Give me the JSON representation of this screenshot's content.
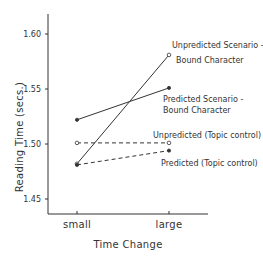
{
  "chart_data": {
    "type": "line",
    "title": "",
    "xlabel": "Time Change",
    "ylabel": "Reading Time (secs.)",
    "categories": [
      "small",
      "large"
    ],
    "ylim": [
      1.44,
      1.62
    ],
    "yticks": [
      1.45,
      1.5,
      1.55,
      1.6
    ],
    "ytick_labels": [
      "1.45",
      "1.50",
      "1.55",
      "1.60"
    ],
    "grid": false,
    "legend": "inline annotations at right",
    "series": [
      {
        "name": "Unpredicted Scenario-Bound Character",
        "label_lines": [
          "Unpredicted Scenario -",
          "Bound Character"
        ],
        "values": [
          1.482,
          1.581
        ],
        "line_style": "solid",
        "marker": "open-circle"
      },
      {
        "name": "Predicted Scenario-Bound Character",
        "label_lines": [
          "Predicted Scenario -",
          "Bound Character"
        ],
        "values": [
          1.522,
          1.551
        ],
        "line_style": "solid",
        "marker": "filled-circle"
      },
      {
        "name": "Unpredicted (Topic control)",
        "label_lines": [
          "Unpredicted (Topic control)"
        ],
        "values": [
          1.501,
          1.501
        ],
        "line_style": "dashed",
        "marker": "open-circle"
      },
      {
        "name": "Predicted (Topic control)",
        "label_lines": [
          "Predicted (Topic control)"
        ],
        "values": [
          1.481,
          1.494
        ],
        "line_style": "dashed",
        "marker": "filled-circle"
      }
    ]
  },
  "colors": {
    "ink": "#333333",
    "background": "#ffffff"
  }
}
